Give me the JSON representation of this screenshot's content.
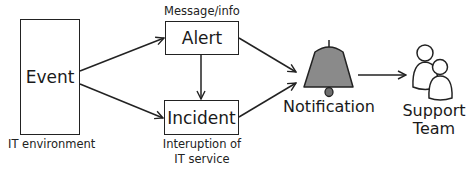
{
  "diagram": {
    "nodes": {
      "event": {
        "label": "Event",
        "caption": "IT environment"
      },
      "alert": {
        "label": "Alert",
        "caption": "Message/info"
      },
      "incident": {
        "label": "Incident",
        "caption_line1": "Interuption of",
        "caption_line2": "IT service"
      },
      "notification": {
        "label": "Notification",
        "icon": "bell-icon"
      },
      "support_team": {
        "label_line1": "Support",
        "label_line2": "Team",
        "icon": "users-icon"
      }
    },
    "edges": [
      {
        "from": "Event",
        "to": "Alert"
      },
      {
        "from": "Event",
        "to": "Incident"
      },
      {
        "from": "Alert",
        "to": "Incident"
      },
      {
        "from": "Alert",
        "to": "Notification"
      },
      {
        "from": "Incident",
        "to": "Notification"
      },
      {
        "from": "Notification",
        "to": "Support Team"
      }
    ],
    "colors": {
      "bell_fill": "#8a8a8a",
      "stroke": "#222222"
    }
  }
}
